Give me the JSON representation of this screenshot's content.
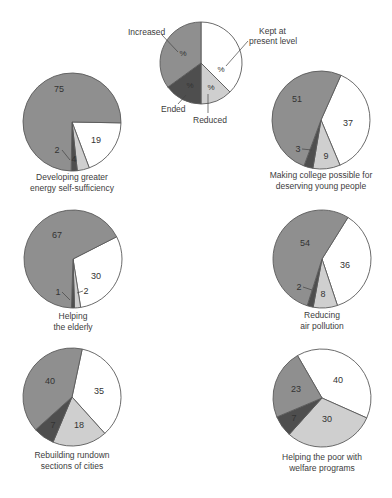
{
  "colors": {
    "increased": "#8f8f8f",
    "kept": "#ffffff",
    "reduced": "#cfcfcf",
    "ended": "#4e4e4e",
    "stroke": "#5a5a5a",
    "text": "#3a3a3a"
  },
  "legend": {
    "increased": "Increased",
    "kept_line1": "Kept at",
    "kept_line2": "present level",
    "ended": "Ended",
    "reduced": "Reduced",
    "placeholder": "%"
  },
  "chart_data": {
    "type": "pie",
    "title": "",
    "series_order": [
      "Kept at present level",
      "Reduced",
      "Ended",
      "Increased"
    ],
    "legend_chart": {
      "label_symbol": "%",
      "categories": [
        "Increased",
        "Kept at present level",
        "Ended",
        "Reduced"
      ]
    },
    "charts": [
      {
        "id": "energy",
        "caption_line1": "Developing greater",
        "caption_line2": "energy self-sufficiency",
        "values": {
          "Increased": 75,
          "Kept at present level": 19,
          "Reduced": 4,
          "Ended": 2
        }
      },
      {
        "id": "college",
        "caption_line1": "Making college possible for",
        "caption_line2": "deserving young people",
        "values": {
          "Increased": 51,
          "Kept at present level": 37,
          "Reduced": 9,
          "Ended": 3
        }
      },
      {
        "id": "elderly",
        "caption_line1": "Helping",
        "caption_line2": "the elderly",
        "values": {
          "Increased": 67,
          "Kept at present level": 30,
          "Reduced": 2,
          "Ended": 1
        }
      },
      {
        "id": "air",
        "caption_line1": "Reducing",
        "caption_line2": "air pollution",
        "values": {
          "Increased": 54,
          "Kept at present level": 36,
          "Reduced": 8,
          "Ended": 2
        }
      },
      {
        "id": "cities",
        "caption_line1": "Rebuilding rundown",
        "caption_line2": "sections of cities",
        "values": {
          "Increased": 40,
          "Kept at present level": 35,
          "Reduced": 18,
          "Ended": 7
        }
      },
      {
        "id": "welfare",
        "caption_line1": "Helping the poor with",
        "caption_line2": "welfare programs",
        "values": {
          "Increased": 23,
          "Kept at present level": 40,
          "Reduced": 30,
          "Ended": 7
        }
      }
    ]
  },
  "layout": {
    "legend_pie": {
      "cx": 201,
      "cy": 63,
      "r": 41,
      "start": 0,
      "slices": [
        [
          "kept",
          37.5
        ],
        [
          "reduced",
          12.5
        ],
        [
          "ended",
          15
        ],
        [
          "increased",
          35
        ]
      ]
    },
    "pies": [
      {
        "cx": 72,
        "cy": 122,
        "r": 49,
        "start": 91
      },
      {
        "cx": 321,
        "cy": 120,
        "r": 49,
        "start": 24
      },
      {
        "cx": 73,
        "cy": 259,
        "r": 49,
        "start": 63
      },
      {
        "cx": 322,
        "cy": 259,
        "r": 49,
        "start": 32
      },
      {
        "cx": 72,
        "cy": 397,
        "r": 49,
        "start": 12
      },
      {
        "cx": 322,
        "cy": 398,
        "r": 49,
        "start": -30
      }
    ]
  },
  "value_labels": [
    [
      {
        "k": "Increased",
        "x": 59,
        "y": 92
      },
      {
        "k": "Kept at present level",
        "x": 96,
        "y": 143
      },
      {
        "k": "Reduced",
        "x": 74,
        "y": 162
      },
      {
        "k": "Ended",
        "x": 57,
        "y": 153
      }
    ],
    [
      {
        "k": "Increased",
        "x": 297,
        "y": 102
      },
      {
        "k": "Kept at present level",
        "x": 348,
        "y": 126
      },
      {
        "k": "Reduced",
        "x": 326,
        "y": 159
      },
      {
        "k": "Ended",
        "x": 298,
        "y": 152
      }
    ],
    [
      {
        "k": "Increased",
        "x": 57,
        "y": 238
      },
      {
        "k": "Kept at present level",
        "x": 96,
        "y": 279
      },
      {
        "k": "Reduced",
        "x": 86,
        "y": 294
      },
      {
        "k": "Ended",
        "x": 58,
        "y": 295
      }
    ],
    [
      {
        "k": "Increased",
        "x": 305,
        "y": 246
      },
      {
        "k": "Kept at present level",
        "x": 345,
        "y": 268
      },
      {
        "k": "Reduced",
        "x": 323,
        "y": 297
      },
      {
        "k": "Ended",
        "x": 299,
        "y": 290
      }
    ],
    [
      {
        "k": "Increased",
        "x": 50,
        "y": 384
      },
      {
        "k": "Kept at present level",
        "x": 99,
        "y": 394
      },
      {
        "k": "Reduced",
        "x": 79,
        "y": 428
      },
      {
        "k": "Ended",
        "x": 53,
        "y": 428
      }
    ],
    [
      {
        "k": "Increased",
        "x": 296,
        "y": 392
      },
      {
        "k": "Kept at present level",
        "x": 338,
        "y": 383
      },
      {
        "k": "Reduced",
        "x": 327,
        "y": 422
      },
      {
        "k": "Ended",
        "x": 294,
        "y": 421
      }
    ]
  ],
  "caption_positions": [
    {
      "x": 72,
      "y": 172
    },
    {
      "x": 321,
      "y": 170
    },
    {
      "x": 73,
      "y": 311
    },
    {
      "x": 322,
      "y": 310
    },
    {
      "x": 72,
      "y": 450
    },
    {
      "x": 322,
      "y": 452
    }
  ]
}
